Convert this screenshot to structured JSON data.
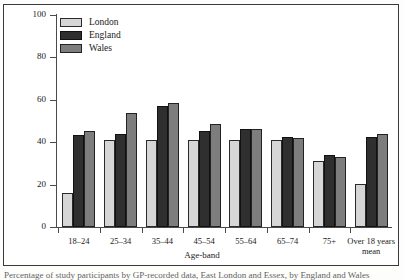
{
  "figure": {
    "caption": "Percentage of study participants by GP-recorded data, East London and Essex, by England and Wales"
  },
  "legend": {
    "position": "top-left-inside",
    "entries": [
      {
        "label": "London",
        "color": "#d6d6d6"
      },
      {
        "label": "England",
        "color": "#2f2f2f"
      },
      {
        "label": "Wales",
        "color": "#7d7d7d"
      }
    ]
  },
  "chart_data": {
    "type": "bar",
    "title": "",
    "xlabel": "Age-band",
    "ylabel": "Percentage",
    "ylim": [
      0,
      100
    ],
    "yticks": [
      0,
      20,
      40,
      60,
      80,
      100
    ],
    "grid": false,
    "categories": [
      "18–24",
      "25–34",
      "35–44",
      "45–54",
      "55–64",
      "65–74",
      "75+",
      "Over 18 years mean"
    ],
    "series": [
      {
        "name": "London",
        "color": "#d6d6d6",
        "values": [
          16,
          41,
          41,
          41,
          41,
          41,
          31,
          20.5
        ]
      },
      {
        "name": "England",
        "color": "#2f2f2f",
        "values": [
          43.5,
          44,
          57,
          45.5,
          46,
          42.5,
          34,
          42.5
        ]
      },
      {
        "name": "Wales",
        "color": "#7d7d7d",
        "values": [
          45.5,
          54,
          58.5,
          48.5,
          46,
          42,
          33,
          44
        ]
      }
    ]
  }
}
